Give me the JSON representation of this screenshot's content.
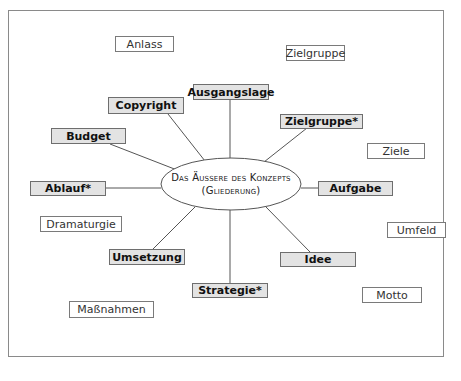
{
  "diagram": {
    "center": {
      "line1": "Das Äussere des Konzepts",
      "line2": "(Gliederung)"
    },
    "primary_nodes": [
      {
        "id": "ausgangslage",
        "label": "Ausgangslage"
      },
      {
        "id": "copyright",
        "label": "Copyright"
      },
      {
        "id": "zielgruppe-star",
        "label": "Zielgruppe*"
      },
      {
        "id": "budget",
        "label": "Budget"
      },
      {
        "id": "ablauf",
        "label": "Ablauf*"
      },
      {
        "id": "aufgabe",
        "label": "Aufgabe"
      },
      {
        "id": "umsetzung",
        "label": "Umsetzung"
      },
      {
        "id": "idee",
        "label": "Idee"
      },
      {
        "id": "strategie",
        "label": "Strategie*"
      }
    ],
    "secondary_nodes": [
      {
        "id": "anlass",
        "label": "Anlass"
      },
      {
        "id": "zielgruppe",
        "label": "Zielgruppe"
      },
      {
        "id": "ziele",
        "label": "Ziele"
      },
      {
        "id": "dramaturgie",
        "label": "Dramaturgie"
      },
      {
        "id": "umfeld",
        "label": "Umfeld"
      },
      {
        "id": "motto",
        "label": "Motto"
      },
      {
        "id": "massnahmen",
        "label": "Maßnahmen"
      }
    ],
    "colors": {
      "primary_fill": "#e3e3e3",
      "secondary_fill": "#ffffff",
      "border": "#7a7a7a",
      "line": "#555555"
    }
  }
}
